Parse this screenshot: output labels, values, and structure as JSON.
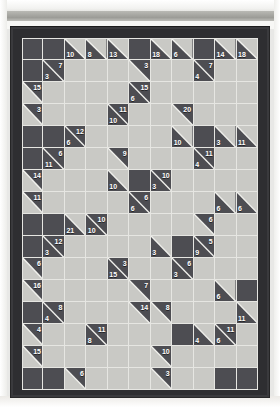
{
  "puzzle": {
    "type": "kakuro",
    "columns": 11,
    "rows": 16,
    "colors": {
      "white_cell": "#c9c9c5",
      "black_cell": "#4d4d52",
      "grid_line": "#e6e6e2",
      "frame": "#2a2a2c",
      "clue_text": "#ffffff"
    },
    "cells": [
      [
        {
          "t": "b"
        },
        {
          "t": "b"
        },
        {
          "t": "c",
          "d": 10
        },
        {
          "t": "c",
          "d": 8
        },
        {
          "t": "c",
          "d": 13
        },
        {
          "t": "b"
        },
        {
          "t": "c",
          "d": 18
        },
        {
          "t": "c",
          "d": 6
        },
        {
          "t": "b"
        },
        {
          "t": "c",
          "d": 14
        },
        {
          "t": "c",
          "d": 18
        }
      ],
      [
        {
          "t": "b"
        },
        {
          "t": "c",
          "d": 3,
          "r": 7
        },
        {
          "t": "w"
        },
        {
          "t": "w"
        },
        {
          "t": "w"
        },
        {
          "t": "c",
          "r": 3
        },
        {
          "t": "w"
        },
        {
          "t": "w"
        },
        {
          "t": "c",
          "d": 4,
          "r": 7
        },
        {
          "t": "w"
        },
        {
          "t": "w"
        }
      ],
      [
        {
          "t": "c",
          "r": 15
        },
        {
          "t": "w"
        },
        {
          "t": "w"
        },
        {
          "t": "w"
        },
        {
          "t": "w"
        },
        {
          "t": "c",
          "d": 6,
          "r": 15
        },
        {
          "t": "w"
        },
        {
          "t": "w"
        },
        {
          "t": "w"
        },
        {
          "t": "w"
        },
        {
          "t": "w"
        }
      ],
      [
        {
          "t": "c",
          "r": 3
        },
        {
          "t": "w"
        },
        {
          "t": "w"
        },
        {
          "t": "w"
        },
        {
          "t": "c",
          "d": 10,
          "r": 11
        },
        {
          "t": "w"
        },
        {
          "t": "w"
        },
        {
          "t": "c",
          "r": 20
        },
        {
          "t": "w"
        },
        {
          "t": "w"
        },
        {
          "t": "w"
        }
      ],
      [
        {
          "t": "b"
        },
        {
          "t": "b"
        },
        {
          "t": "c",
          "d": 6,
          "r": 12
        },
        {
          "t": "w"
        },
        {
          "t": "w"
        },
        {
          "t": "w"
        },
        {
          "t": "w"
        },
        {
          "t": "c",
          "d": 10
        },
        {
          "t": "b"
        },
        {
          "t": "c",
          "d": 3
        },
        {
          "t": "c",
          "d": 11
        }
      ],
      [
        {
          "t": "b"
        },
        {
          "t": "c",
          "d": 11,
          "r": 6
        },
        {
          "t": "w"
        },
        {
          "t": "w"
        },
        {
          "t": "c",
          "r": 9
        },
        {
          "t": "w"
        },
        {
          "t": "w"
        },
        {
          "t": "w"
        },
        {
          "t": "c",
          "d": 4,
          "r": 11
        },
        {
          "t": "w"
        },
        {
          "t": "w"
        }
      ],
      [
        {
          "t": "c",
          "r": 14
        },
        {
          "t": "w"
        },
        {
          "t": "w"
        },
        {
          "t": "w"
        },
        {
          "t": "c",
          "d": 10
        },
        {
          "t": "b"
        },
        {
          "t": "c",
          "d": 3,
          "r": 10
        },
        {
          "t": "w"
        },
        {
          "t": "w"
        },
        {
          "t": "w"
        },
        {
          "t": "w"
        }
      ],
      [
        {
          "t": "c",
          "r": 11
        },
        {
          "t": "w"
        },
        {
          "t": "w"
        },
        {
          "t": "w"
        },
        {
          "t": "w"
        },
        {
          "t": "c",
          "d": 6,
          "r": 6
        },
        {
          "t": "w"
        },
        {
          "t": "w"
        },
        {
          "t": "w"
        },
        {
          "t": "c",
          "d": 6
        },
        {
          "t": "c",
          "d": 6
        }
      ],
      [
        {
          "t": "b"
        },
        {
          "t": "b"
        },
        {
          "t": "c",
          "d": 21
        },
        {
          "t": "c",
          "d": 10,
          "r": 10
        },
        {
          "t": "w"
        },
        {
          "t": "w"
        },
        {
          "t": "w"
        },
        {
          "t": "w"
        },
        {
          "t": "c",
          "r": 6
        },
        {
          "t": "w"
        },
        {
          "t": "w"
        }
      ],
      [
        {
          "t": "b"
        },
        {
          "t": "c",
          "d": 3,
          "r": 12
        },
        {
          "t": "w"
        },
        {
          "t": "w"
        },
        {
          "t": "w"
        },
        {
          "t": "w"
        },
        {
          "t": "c",
          "d": 3
        },
        {
          "t": "b"
        },
        {
          "t": "c",
          "d": 9,
          "r": 5
        },
        {
          "t": "w"
        },
        {
          "t": "w"
        }
      ],
      [
        {
          "t": "c",
          "r": 6
        },
        {
          "t": "w"
        },
        {
          "t": "w"
        },
        {
          "t": "w"
        },
        {
          "t": "c",
          "d": 15,
          "r": 3
        },
        {
          "t": "w"
        },
        {
          "t": "w"
        },
        {
          "t": "c",
          "d": 3,
          "r": 6
        },
        {
          "t": "w"
        },
        {
          "t": "w"
        },
        {
          "t": "w"
        }
      ],
      [
        {
          "t": "c",
          "r": 16
        },
        {
          "t": "w"
        },
        {
          "t": "w"
        },
        {
          "t": "w"
        },
        {
          "t": "w"
        },
        {
          "t": "c",
          "r": 7
        },
        {
          "t": "w"
        },
        {
          "t": "w"
        },
        {
          "t": "w"
        },
        {
          "t": "c",
          "d": 6
        },
        {
          "t": "b"
        }
      ],
      [
        {
          "t": "b"
        },
        {
          "t": "c",
          "d": 4,
          "r": 8
        },
        {
          "t": "w"
        },
        {
          "t": "w"
        },
        {
          "t": "w"
        },
        {
          "t": "c",
          "r": 14
        },
        {
          "t": "c",
          "r": 8
        },
        {
          "t": "w"
        },
        {
          "t": "w"
        },
        {
          "t": "w"
        },
        {
          "t": "c",
          "d": 11
        }
      ],
      [
        {
          "t": "c",
          "r": 4
        },
        {
          "t": "w"
        },
        {
          "t": "w"
        },
        {
          "t": "c",
          "d": 8,
          "r": 11
        },
        {
          "t": "w"
        },
        {
          "t": "w"
        },
        {
          "t": "w"
        },
        {
          "t": "b"
        },
        {
          "t": "c",
          "d": 4
        },
        {
          "t": "c",
          "d": 6,
          "r": 11
        },
        {
          "t": "w"
        }
      ],
      [
        {
          "t": "c",
          "r": 15
        },
        {
          "t": "w"
        },
        {
          "t": "w"
        },
        {
          "t": "w"
        },
        {
          "t": "w"
        },
        {
          "t": "w"
        },
        {
          "t": "c",
          "r": 10
        },
        {
          "t": "w"
        },
        {
          "t": "w"
        },
        {
          "t": "w"
        },
        {
          "t": "w"
        }
      ],
      [
        {
          "t": "b"
        },
        {
          "t": "b"
        },
        {
          "t": "c",
          "r": 6
        },
        {
          "t": "w"
        },
        {
          "t": "w"
        },
        {
          "t": "w"
        },
        {
          "t": "c",
          "r": 3
        },
        {
          "t": "w"
        },
        {
          "t": "w"
        },
        {
          "t": "b"
        },
        {
          "t": "b"
        }
      ]
    ]
  }
}
